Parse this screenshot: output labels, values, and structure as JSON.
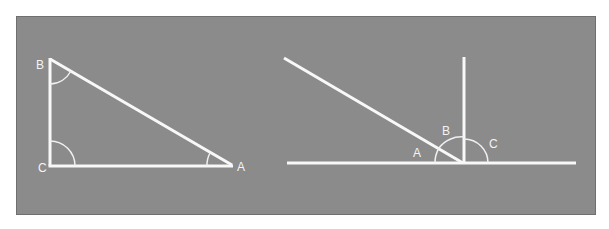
{
  "figure": {
    "background_color": "#8b8b8b",
    "line_color": "#f8f8f8",
    "left_diagram": {
      "description": "Right triangle with vertices B, C, A; right angle at C; angles marked at B, C, A",
      "labels": {
        "B": "B",
        "C": "C",
        "A": "A"
      }
    },
    "right_diagram": {
      "description": "Straight line with a perpendicular and an oblique line meeting at one point; angles A, B, C marked along the straight line",
      "labels": {
        "A": "A",
        "B": "B",
        "C": "C"
      }
    }
  }
}
